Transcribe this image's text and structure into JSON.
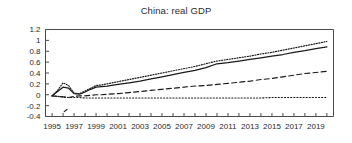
{
  "chart_data": {
    "type": "line",
    "title": "China: real GDP",
    "xlabel": "",
    "ylabel": "",
    "xlim": [
      1994.4,
      2020.6
    ],
    "ylim": [
      -0.4,
      1.2
    ],
    "grid": false,
    "legend": "none",
    "ytick_labels": [
      "1.2",
      "1",
      "0.8",
      "0.6",
      "0.4",
      "0.2",
      "0",
      "-0.2",
      "-0.4"
    ],
    "ytick_values": [
      1.2,
      1.0,
      0.8,
      0.6,
      0.4,
      0.2,
      0.0,
      -0.2,
      -0.4
    ],
    "xtick_labels": [
      "1995",
      "1997",
      "1999",
      "2001",
      "2003",
      "2005",
      "2007",
      "2009",
      "2011",
      "2013",
      "2015",
      "2017",
      "2019"
    ],
    "xtick_values": [
      1995,
      1997,
      1999,
      2001,
      2003,
      2005,
      2007,
      2009,
      2011,
      2013,
      2015,
      2017,
      2019
    ],
    "x": [
      1995,
      1995.5,
      1996,
      1996.5,
      1997,
      1997.5,
      1998,
      1998.5,
      1999,
      1999.5,
      2000,
      2001,
      2002,
      2003,
      2004,
      2005,
      2006,
      2007,
      2008,
      2009,
      2010,
      2011,
      2012,
      2013,
      2014,
      2015,
      2016,
      2017,
      2018,
      2019,
      2020
    ],
    "series": [
      {
        "name": "solid-line",
        "style": "solid",
        "color": "#1a1a1a",
        "values": [
          -0.02,
          0.06,
          0.14,
          0.12,
          0.02,
          0.01,
          0.05,
          0.1,
          0.14,
          0.15,
          0.16,
          0.19,
          0.22,
          0.25,
          0.29,
          0.33,
          0.37,
          0.41,
          0.45,
          0.5,
          0.57,
          0.59,
          0.62,
          0.65,
          0.68,
          0.71,
          0.74,
          0.78,
          0.81,
          0.85,
          0.88
        ]
      },
      {
        "name": "upper-dotted-line",
        "style": "dotted",
        "color": "#1a1a1a",
        "values": [
          -0.02,
          0.08,
          0.22,
          0.17,
          0.03,
          0.02,
          0.07,
          0.12,
          0.17,
          0.18,
          0.2,
          0.24,
          0.28,
          0.32,
          0.36,
          0.4,
          0.44,
          0.48,
          0.52,
          0.57,
          0.62,
          0.65,
          0.68,
          0.71,
          0.75,
          0.78,
          0.82,
          0.86,
          0.9,
          0.94,
          0.98
        ]
      },
      {
        "name": "middle-dashed-line",
        "style": "dashed",
        "color": "#1a1a1a",
        "values": [
          -0.02,
          -0.03,
          -0.04,
          -0.05,
          -0.03,
          -0.02,
          -0.02,
          -0.01,
          0.0,
          0.0,
          0.01,
          0.02,
          0.04,
          0.06,
          0.08,
          0.1,
          0.12,
          0.14,
          0.16,
          0.17,
          0.19,
          0.21,
          0.23,
          0.25,
          0.28,
          0.3,
          0.33,
          0.36,
          0.39,
          0.41,
          0.43
        ]
      },
      {
        "name": "flat-dotted-line",
        "style": "fine-dotted",
        "color": "#1a1a1a",
        "values": [
          -0.02,
          -0.03,
          -0.04,
          -0.05,
          -0.05,
          -0.05,
          -0.06,
          -0.06,
          -0.06,
          -0.06,
          -0.06,
          -0.06,
          -0.06,
          -0.06,
          -0.06,
          -0.06,
          -0.06,
          -0.06,
          -0.06,
          -0.06,
          -0.06,
          -0.06,
          -0.06,
          -0.06,
          -0.06,
          -0.05,
          -0.05,
          -0.05,
          -0.05,
          -0.05,
          -0.05
        ]
      },
      {
        "name": "lower-excursion-segment",
        "style": "dashed",
        "color": "#1a1a1a",
        "values_x": [
          1996.1,
          1996.35
        ],
        "values_y": [
          -0.31,
          -0.27
        ]
      }
    ]
  }
}
